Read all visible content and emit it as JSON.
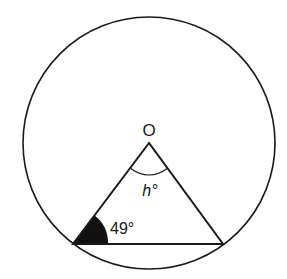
{
  "diagram": {
    "center_label": "O",
    "angle_at_center_label": "h°",
    "angle_at_center_var": "h",
    "base_angle_label": "49°",
    "base_angle_value": 49,
    "colors": {
      "stroke": "#1a1a1a",
      "shaded_angle": "#111111",
      "background": "#ffffff"
    }
  }
}
